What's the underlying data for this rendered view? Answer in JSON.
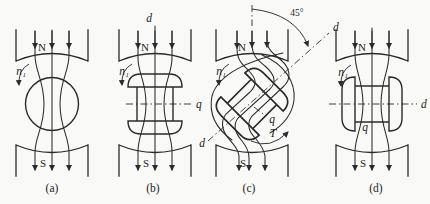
{
  "figure": {
    "colors": {
      "paper": "#f9f9f7",
      "ink": "#2b2b2b"
    }
  },
  "panels": [
    {
      "caption": "(a)",
      "top_pole": "N",
      "bottom_pole": "S",
      "speed": "n₁"
    },
    {
      "caption": "(b)",
      "top_pole": "N",
      "bottom_pole": "S",
      "speed": "n₁",
      "d_axis": "d",
      "q_axis": "q"
    },
    {
      "caption": "(c)",
      "top_pole": "N",
      "bottom_pole": "S",
      "speed": "n₁",
      "d_axis": "d",
      "d_axis_far": "d",
      "q_axis": "q",
      "torque": "T",
      "angle": "45°"
    },
    {
      "caption": "(d)",
      "top_pole": "N",
      "bottom_pole": "S",
      "speed": "n₁",
      "d_axis": "d",
      "q_axis": "q"
    }
  ]
}
